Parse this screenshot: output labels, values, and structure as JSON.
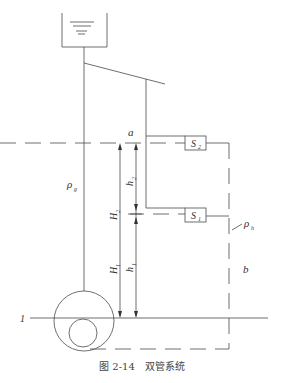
{
  "caption": "图 2-14　双管系统",
  "labels": {
    "point_a": "a",
    "rho_g": "ρ",
    "rho_g_sub": "g",
    "rho_h": "ρ",
    "rho_h_sub": "h",
    "H2": "H",
    "H2_sub": "2",
    "H1": "H",
    "H1_sub": "1",
    "h2": "h",
    "h2_sub": "2",
    "h1": "h",
    "h1_sub": "1",
    "b": "b",
    "ref_1": "1",
    "S2": "S",
    "S2_sub": "2",
    "S1": "S",
    "S1_sub": "1"
  }
}
